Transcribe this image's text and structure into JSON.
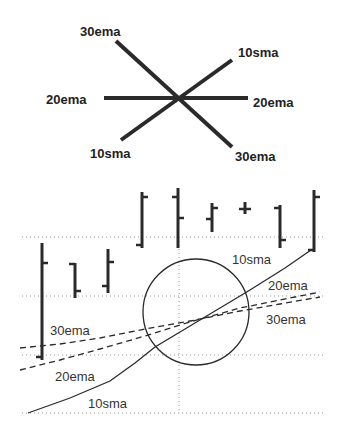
{
  "colors": {
    "ink": "#2a2a2a",
    "grid": "#9a9a9a",
    "background": "#ffffff"
  },
  "crossover_diagram": {
    "center": [
      179,
      98
    ],
    "lines": [
      {
        "name": "30ema",
        "from": [
          116,
          41
        ],
        "to": [
          232,
          147
        ]
      },
      {
        "name": "10sma",
        "from": [
          121,
          140
        ],
        "to": [
          232,
          60
        ]
      },
      {
        "name": "20ema",
        "from": [
          104,
          98
        ],
        "to": [
          248,
          98
        ]
      }
    ],
    "labels": [
      {
        "text": "30ema",
        "x": 80,
        "y": 36
      },
      {
        "text": "10sma",
        "x": 238,
        "y": 57
      },
      {
        "text": "20ema",
        "x": 46,
        "y": 104
      },
      {
        "text": "20ema",
        "x": 253,
        "y": 107
      },
      {
        "text": "10sma",
        "x": 90,
        "y": 158
      },
      {
        "text": "30ema",
        "x": 235,
        "y": 161
      }
    ]
  },
  "price_chart": {
    "grid": {
      "horizontal_y": [
        237,
        296,
        355,
        413
      ],
      "x_start": 22,
      "x_end": 325,
      "vertical_x": 179,
      "vertical_y_start": 237,
      "vertical_y_end": 413
    },
    "ohlc_bars": [
      {
        "x": 42,
        "high": 243,
        "low": 360,
        "open": 357,
        "close": 263
      },
      {
        "x": 75,
        "high": 263,
        "low": 298,
        "open": 264,
        "close": 291
      },
      {
        "x": 108,
        "high": 249,
        "low": 293,
        "open": 286,
        "close": 262
      },
      {
        "x": 142,
        "high": 192,
        "low": 248,
        "open": 245,
        "close": 197
      },
      {
        "x": 178,
        "high": 188,
        "low": 248,
        "open": 197,
        "close": 218
      },
      {
        "x": 212,
        "high": 203,
        "low": 232,
        "open": 219,
        "close": 208
      },
      {
        "x": 245,
        "high": 202,
        "low": 214,
        "open": 209,
        "close": 209
      },
      {
        "x": 280,
        "high": 205,
        "low": 248,
        "open": 208,
        "close": 240
      },
      {
        "x": 314,
        "high": 190,
        "low": 252,
        "open": 250,
        "close": 197
      }
    ],
    "moving_averages": [
      {
        "name": "10sma",
        "style": "solid",
        "points": [
          [
            28,
            413
          ],
          [
            70,
            398
          ],
          [
            110,
            381
          ],
          [
            135,
            363
          ],
          [
            155,
            347
          ],
          [
            180,
            332
          ],
          [
            215,
            311
          ],
          [
            250,
            290
          ],
          [
            285,
            268
          ],
          [
            311,
            250
          ]
        ]
      },
      {
        "name": "20ema",
        "style": "dashed",
        "points": [
          [
            20,
            370
          ],
          [
            60,
            360
          ],
          [
            100,
            349
          ],
          [
            145,
            336
          ],
          [
            190,
            322
          ],
          [
            240,
            308
          ],
          [
            280,
            300
          ],
          [
            320,
            292
          ]
        ]
      },
      {
        "name": "30ema",
        "style": "dashed",
        "points": [
          [
            20,
            348
          ],
          [
            60,
            344
          ],
          [
            100,
            338
          ],
          [
            145,
            329
          ],
          [
            190,
            321
          ],
          [
            240,
            311
          ],
          [
            280,
            304
          ],
          [
            320,
            297
          ]
        ]
      }
    ],
    "highlight_circle": {
      "cx": 196,
      "cy": 312,
      "r": 53
    },
    "labels": [
      {
        "text": "10sma",
        "x": 232,
        "y": 264
      },
      {
        "text": "20ema",
        "x": 268,
        "y": 290
      },
      {
        "text": "30ema",
        "x": 266,
        "y": 324
      },
      {
        "text": "30ema",
        "x": 50,
        "y": 335
      },
      {
        "text": "20ema",
        "x": 55,
        "y": 381
      },
      {
        "text": "10sma",
        "x": 88,
        "y": 408
      }
    ]
  }
}
